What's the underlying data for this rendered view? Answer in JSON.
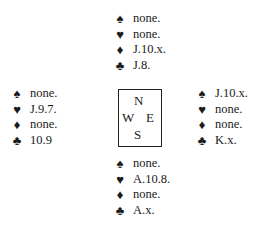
{
  "hands": {
    "north": {
      "spades": "none.",
      "hearts": "none.",
      "diamonds": "J.10.x.",
      "clubs": "J.8."
    },
    "west": {
      "spades": "none.",
      "hearts": "J.9.7.",
      "diamonds": "none.",
      "clubs": "10.9"
    },
    "east": {
      "spades": "J.10.x.",
      "hearts": "none.",
      "diamonds": "none.",
      "clubs": "K.x."
    },
    "south": {
      "spades": "none.",
      "hearts": "A.10.8.",
      "diamonds": "none.",
      "clubs": "A.x."
    }
  },
  "compass": {
    "n": "N",
    "w": "W",
    "e": "E",
    "s": "S"
  },
  "suits": {
    "spades": "♠",
    "hearts": "♥",
    "diamonds": "♦",
    "clubs": "♣"
  }
}
